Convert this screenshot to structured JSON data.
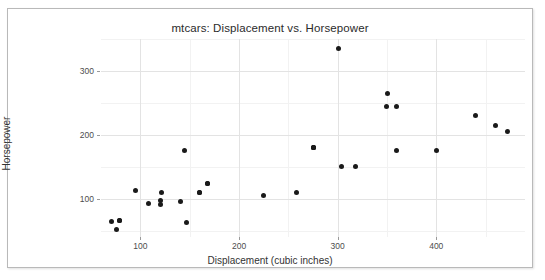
{
  "chart_data": {
    "type": "scatter",
    "title": "mtcars: Displacement vs. Horsepower",
    "xlabel": "Displacement (cubic inches)",
    "ylabel": "Horsepower",
    "xlim": [
      60,
      490
    ],
    "ylim": [
      40,
      350
    ],
    "xticks": [
      100,
      200,
      300,
      400
    ],
    "xtick_labels": [
      "100",
      "200",
      "300",
      "400"
    ],
    "yticks": [
      100,
      200,
      300
    ],
    "ytick_labels": [
      "100",
      "200",
      "300"
    ],
    "x_minor_ticks": [
      150,
      250,
      350,
      450
    ],
    "y_minor_ticks": [
      50,
      150,
      250,
      350
    ],
    "grid": true,
    "legend": null,
    "marker": "filled-circle",
    "marker_color": "#1a1a1a",
    "points": [
      {
        "x": 160.0,
        "y": 110
      },
      {
        "x": 160.0,
        "y": 110
      },
      {
        "x": 108.0,
        "y": 93
      },
      {
        "x": 258.0,
        "y": 110
      },
      {
        "x": 360.0,
        "y": 175
      },
      {
        "x": 225.0,
        "y": 105
      },
      {
        "x": 360.0,
        "y": 245
      },
      {
        "x": 146.7,
        "y": 62
      },
      {
        "x": 140.8,
        "y": 95
      },
      {
        "x": 167.6,
        "y": 123
      },
      {
        "x": 167.6,
        "y": 123
      },
      {
        "x": 275.8,
        "y": 180
      },
      {
        "x": 275.8,
        "y": 180
      },
      {
        "x": 275.8,
        "y": 180
      },
      {
        "x": 472.0,
        "y": 205
      },
      {
        "x": 460.0,
        "y": 215
      },
      {
        "x": 440.0,
        "y": 230
      },
      {
        "x": 78.7,
        "y": 66
      },
      {
        "x": 75.7,
        "y": 52
      },
      {
        "x": 71.1,
        "y": 65
      },
      {
        "x": 120.1,
        "y": 97
      },
      {
        "x": 318.0,
        "y": 150
      },
      {
        "x": 304.0,
        "y": 150
      },
      {
        "x": 350.0,
        "y": 245
      },
      {
        "x": 400.0,
        "y": 175
      },
      {
        "x": 79.0,
        "y": 66
      },
      {
        "x": 120.3,
        "y": 91
      },
      {
        "x": 95.1,
        "y": 113
      },
      {
        "x": 351.0,
        "y": 264
      },
      {
        "x": 145.0,
        "y": 175
      },
      {
        "x": 301.0,
        "y": 335
      },
      {
        "x": 121.0,
        "y": 109
      }
    ]
  },
  "colors": {
    "frame_border": "#b9b9b9",
    "major_grid": "#e3e3e3",
    "minor_grid": "#f2f2f2",
    "point": "#1a1a1a",
    "text": "#333333",
    "background": "#ffffff"
  }
}
